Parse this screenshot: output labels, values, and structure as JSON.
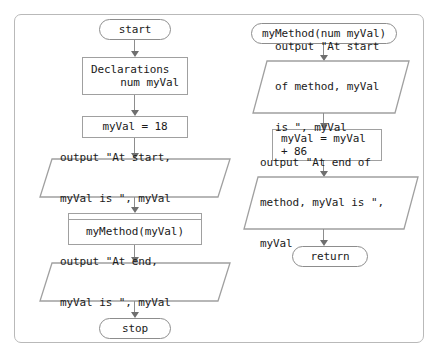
{
  "diagram": {
    "background_color": "#ffffff",
    "stroke_color": "#8d8d8d",
    "text_color": "#1a1a1a"
  },
  "main_flow": {
    "start": "start",
    "declarations": {
      "line1": "Declarations",
      "line2": "num myVal"
    },
    "assign": "myVal = 18",
    "output_start": {
      "line1": "output \"At start,",
      "line2": "myVal is \", myVal"
    },
    "call_method": "myMethod(myVal)",
    "output_end": {
      "line1": "output \"At end,",
      "line2": "myVal is \", myVal"
    },
    "stop": "stop"
  },
  "method_flow": {
    "header": "myMethod(num myVal)",
    "output_start": {
      "line1": "output \"At start",
      "line2": "of method, myVal",
      "line3": "is \", myVal"
    },
    "assign": {
      "line1": "myVal = myVal",
      "line2": "+ 86"
    },
    "output_end": {
      "line1": "output \"At end of",
      "line2": "method, myVal is \",",
      "line3": "myVal"
    },
    "return": "return"
  }
}
